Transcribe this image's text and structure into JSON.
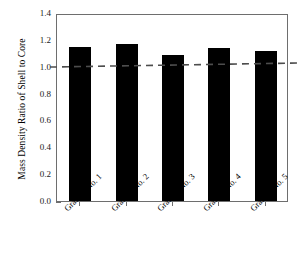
{
  "chart_data": {
    "type": "bar",
    "title": "",
    "xlabel": "",
    "ylabel": "Mass Density Ratio of Shell to Core",
    "categories": [
      "Granule No. 1",
      "Granule No. 2",
      "Granule No. 3",
      "Granule No. 4",
      "Granule No. 5"
    ],
    "values": [
      1.15,
      1.17,
      1.09,
      1.14,
      1.12
    ],
    "ylim": [
      0.0,
      1.4
    ],
    "ytick_labels": [
      "0.0",
      "0.2",
      "0.4",
      "0.6",
      "0.8",
      "1.0",
      "1.2",
      "1.4"
    ],
    "ytick_values": [
      0.0,
      0.2,
      0.4,
      0.6,
      0.8,
      1.0,
      1.2,
      1.4
    ],
    "grid": false,
    "legend": null,
    "bar_color": "#000000",
    "frame_color": "#6e6e6e",
    "reference_line": {
      "label": "",
      "value": 1.0,
      "style": "dashed",
      "color": "#4d4d4d",
      "left_value": 1.005,
      "right_value": 1.035
    }
  }
}
